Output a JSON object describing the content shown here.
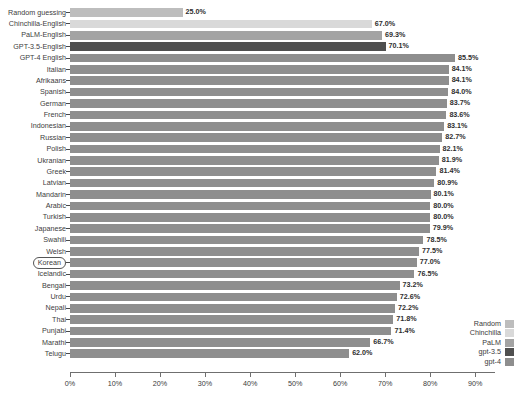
{
  "chart_data": {
    "type": "bar",
    "orientation": "horizontal",
    "title": "",
    "xlabel": "",
    "ylabel": "",
    "xlim": [
      0,
      94.4
    ],
    "grid": false,
    "xticks": [
      "0%",
      "10%",
      "20%",
      "30%",
      "40%",
      "50%",
      "60%",
      "70%",
      "80%",
      "90%"
    ],
    "xtick_values": [
      0,
      10,
      20,
      30,
      40,
      50,
      60,
      70,
      80,
      90
    ],
    "legend_position": "bottom-right",
    "highlighted_category": "Korean",
    "categories": [
      "Random guessing",
      "Chinchilla-English",
      "PaLM-English",
      "GPT-3.5-English",
      "GPT-4 English",
      "Italian",
      "Afrikaans",
      "Spanish",
      "German",
      "French",
      "Indonesian",
      "Russian",
      "Polish",
      "Ukranian",
      "Greek",
      "Latvian",
      "Mandarin",
      "Arabic",
      "Turkish",
      "Japanese",
      "Swahili",
      "Welsh",
      "Korean",
      "Icelandic",
      "Bengali",
      "Urdu",
      "Nepali",
      "Thai",
      "Punjabi",
      "Marathi",
      "Telugu"
    ],
    "values": [
      25.0,
      67.0,
      69.3,
      70.1,
      85.5,
      84.1,
      84.1,
      84.0,
      83.7,
      83.6,
      83.1,
      82.7,
      82.1,
      81.9,
      81.4,
      80.9,
      80.1,
      80.0,
      80.0,
      79.9,
      78.5,
      77.5,
      77.0,
      76.5,
      73.2,
      72.6,
      72.2,
      71.8,
      71.4,
      66.7,
      62.0
    ],
    "value_labels": [
      "25.0%",
      "67.0%",
      "69.3%",
      "70.1%",
      "85.5%",
      "84.1%",
      "84.1%",
      "84.0%",
      "83.7%",
      "83.6%",
      "83.1%",
      "82.7%",
      "82.1%",
      "81.9%",
      "81.4%",
      "80.9%",
      "80.1%",
      "80.0%",
      "80.0%",
      "79.9%",
      "78.5%",
      "77.5%",
      "77.0%",
      "76.5%",
      "73.2%",
      "72.6%",
      "72.2%",
      "71.8%",
      "71.4%",
      "66.7%",
      "62.0%"
    ],
    "series_of_bar": [
      "Random",
      "Chinchilla",
      "PaLM",
      "gpt-3.5",
      "gpt-4",
      "gpt-4",
      "gpt-4",
      "gpt-4",
      "gpt-4",
      "gpt-4",
      "gpt-4",
      "gpt-4",
      "gpt-4",
      "gpt-4",
      "gpt-4",
      "gpt-4",
      "gpt-4",
      "gpt-4",
      "gpt-4",
      "gpt-4",
      "gpt-4",
      "gpt-4",
      "gpt-4",
      "gpt-4",
      "gpt-4",
      "gpt-4",
      "gpt-4",
      "gpt-4",
      "gpt-4",
      "gpt-4",
      "gpt-4"
    ],
    "legend": [
      {
        "label": "Random",
        "color": "#bdbdbd"
      },
      {
        "label": "Chinchilla",
        "color": "#d9d9d9"
      },
      {
        "label": "PaLM",
        "color": "#a3a3a3"
      },
      {
        "label": "gpt-3.5",
        "color": "#4f4f4f"
      },
      {
        "label": "gpt-4",
        "color": "#8e8e8e"
      }
    ],
    "colors": {
      "Random": "#bdbdbd",
      "Chinchilla": "#d9d9d9",
      "PaLM": "#a3a3a3",
      "gpt-3.5": "#4f4f4f",
      "gpt-4": "#8e8e8e"
    }
  }
}
